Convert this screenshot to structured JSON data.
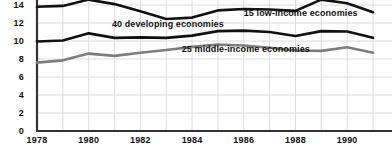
{
  "chart_data": {
    "type": "line",
    "title": "",
    "subtitle": "",
    "xlabel": "",
    "ylabel": "",
    "xlim": [
      1978,
      1991
    ],
    "ylim": [
      0,
      14.6
    ],
    "grid": true,
    "legend_position": "inline-annotations",
    "x": [
      1978,
      1979,
      1980,
      1981,
      1982,
      1983,
      1984,
      1985,
      1986,
      1987,
      1988,
      1989,
      1990,
      1991
    ],
    "xticks": [
      "1978",
      "1980",
      "1982",
      "1984",
      "1986",
      "1988",
      "1990"
    ],
    "xtick_values": [
      1978,
      1980,
      1982,
      1984,
      1986,
      1988,
      1990
    ],
    "yticks": [
      "0",
      "2",
      "4",
      "6",
      "8",
      "10",
      "12",
      "14"
    ],
    "ytick_values": [
      0,
      2,
      4,
      6,
      8,
      10,
      12,
      14
    ],
    "series": [
      {
        "name": "15 low-income economies",
        "color": "#111111",
        "width": 2.6,
        "values": [
          13.8,
          13.9,
          14.6,
          14.1,
          13.3,
          12.45,
          12.6,
          13.4,
          13.55,
          13.5,
          13.35,
          14.6,
          14.2,
          13.2
        ]
      },
      {
        "name": "40 developing economies",
        "color": "#111111",
        "width": 2.6,
        "values": [
          9.95,
          10.05,
          10.85,
          10.35,
          10.4,
          10.35,
          10.6,
          11.1,
          11.15,
          11.0,
          10.55,
          11.1,
          11.05,
          10.35
        ]
      },
      {
        "name": "25 middle-income economies",
        "color": "#7d7d7d",
        "width": 2.6,
        "values": [
          7.6,
          7.85,
          8.6,
          8.35,
          8.7,
          9.0,
          9.35,
          9.6,
          9.5,
          9.25,
          8.95,
          8.9,
          9.3,
          8.7
        ]
      }
    ],
    "annotations": [
      {
        "text": "15 low-income economies",
        "x": 1986.0,
        "y": 13.0
      },
      {
        "text": "40 developing economies",
        "x": 1980.9,
        "y": 11.75
      },
      {
        "text": "25 middle-income economies",
        "x": 1983.6,
        "y": 8.95
      }
    ]
  },
  "axis": {
    "y_axis_name": "y-axis",
    "x_axis_name": "x-axis"
  }
}
